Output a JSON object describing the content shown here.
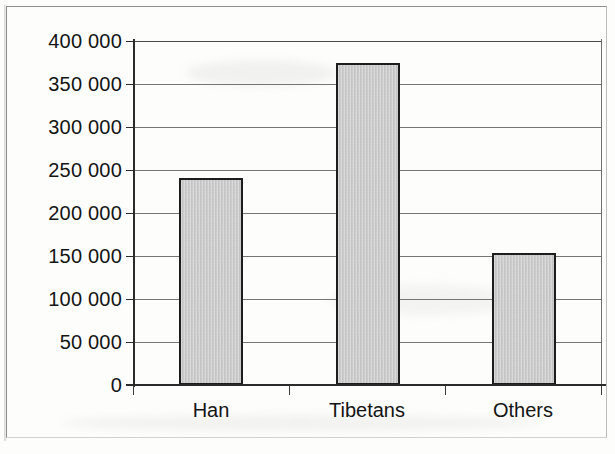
{
  "chart_data": {
    "type": "bar",
    "title": "",
    "subtitle": "",
    "xlabel": "",
    "ylabel": "",
    "categories": [
      "Han",
      "Tibetans",
      "Others"
    ],
    "values": [
      241000,
      374000,
      153000
    ],
    "series": [
      {
        "name": "Population",
        "values": [
          241000,
          374000,
          153000
        ]
      }
    ],
    "ylim": [
      0,
      400000
    ],
    "ytick_step": 50000,
    "ytick_values": [
      400000,
      350000,
      300000,
      250000,
      200000,
      150000,
      100000,
      50000,
      0
    ],
    "ytick_labels": [
      "400 000",
      "350 000",
      "300 000",
      "250 000",
      "200 000",
      "150 000",
      "100 000",
      "50 000",
      "0"
    ],
    "grid": true,
    "grid_axis": "y",
    "legend": false,
    "legend_position": "none",
    "bar_fill_color": "#c9c9c9",
    "bar_border_color": "#1d1d1d",
    "axis_color": "#2b2b2b",
    "gridline_color": "#757575",
    "background_color": "#fdfdfc",
    "annotations": []
  },
  "figure": {
    "frame_visible": true,
    "frame_color": "#8d8d8d"
  }
}
